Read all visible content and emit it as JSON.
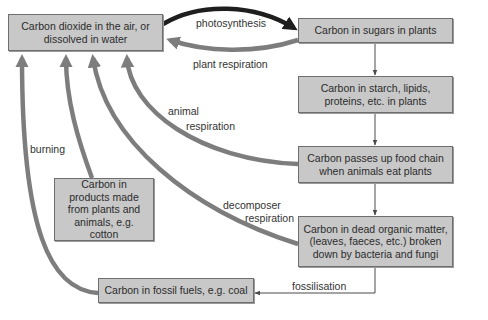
{
  "boxes": {
    "co2": "Carbon dioxide in the air, or dissolved in water",
    "sugars": "Carbon in sugars in plants",
    "starch": "Carbon in starch, lipids, proteins, etc. in plants",
    "food_chain": "Carbon passes up food chain when animals eat plants",
    "dead_matter": "Carbon in dead organic matter, (leaves, faeces, etc.) broken down by bacteria and fungi",
    "products": "Carbon in products made from plants and animals, e.g. cotton",
    "fossil": "Carbon in fossil fuels, e.g. coal"
  },
  "labels": {
    "photosynthesis": "photosynthesis",
    "plant_respiration": "plant respiration",
    "animal_respiration_1": "animal",
    "animal_respiration_2": "respiration",
    "burning": "burning",
    "decomposer_1": "decomposer",
    "decomposer_2": "respiration",
    "fossilisation": "fossilisation"
  },
  "colors": {
    "box_fill": "#c8c8c8",
    "box_border": "#6e6e6e",
    "thick_arrow": "#7d7d7d",
    "photosynthesis_arrow": "#1e1e1e",
    "thin_arrow": "#4a4a4a"
  }
}
